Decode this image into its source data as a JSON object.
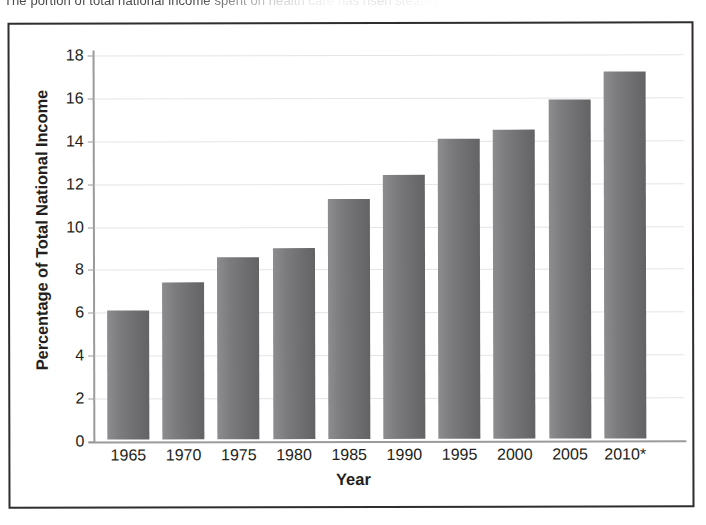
{
  "caption": {
    "text": "The portion of total national income spent on health care has risen steadily."
  },
  "chart_data": {
    "type": "bar",
    "title": "",
    "xlabel": "Year",
    "ylabel": "Percentage of Total National Income",
    "categories": [
      "1965",
      "1970",
      "1975",
      "1980",
      "1985",
      "1990",
      "1995",
      "2000",
      "2005",
      "2010*"
    ],
    "values": [
      6.0,
      7.3,
      8.5,
      8.9,
      11.2,
      12.3,
      14.0,
      14.4,
      15.8,
      17.1
    ],
    "ylim": [
      0,
      18
    ],
    "yticks": [
      0,
      2,
      4,
      6,
      8,
      10,
      12,
      14,
      16,
      18
    ],
    "ytick_labels": [
      "0",
      "2",
      "4",
      "6",
      "8",
      "10",
      "12",
      "14",
      "16",
      "18"
    ],
    "grid": true,
    "legend": "none",
    "bar_color": "#6e6e70",
    "gridline_color": "#e4e4e6",
    "axis_color": "#9a9a9c",
    "frame_color": "#2f2d2e",
    "footnote_marker": "*"
  }
}
